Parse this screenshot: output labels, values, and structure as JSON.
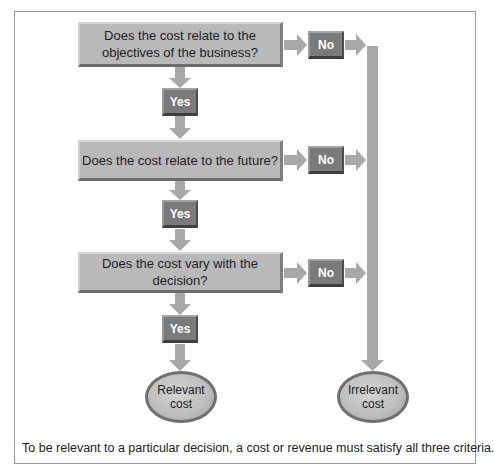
{
  "diagram": {
    "type": "flowchart",
    "questions": [
      {
        "id": "q1",
        "text": "Does the cost relate to the objectives of the business?",
        "line1": "Does the cost relate to the",
        "line2": "objectives of the business?"
      },
      {
        "id": "q2",
        "text": "Does the cost relate to the future?"
      },
      {
        "id": "q3",
        "text": "Does the cost vary with the decision?"
      }
    ],
    "yes_label": "Yes",
    "no_label": "No",
    "outcomes": {
      "relevant": "Relevant cost",
      "irrelevant": "Irrelevant cost"
    },
    "caption": "To be relevant to a particular decision, a cost or revenue must satisfy all three criteria.",
    "colors": {
      "question_box": "#b9b9b9",
      "answer_box": "#7a7a7a",
      "arrow": "#a8a8a8",
      "ellipse": "#bdbdbd",
      "frame": "#9a9a9a"
    },
    "edges": [
      {
        "from": "q1",
        "to": "yes1"
      },
      {
        "from": "yes1",
        "to": "q2"
      },
      {
        "from": "q2",
        "to": "yes2"
      },
      {
        "from": "yes2",
        "to": "q3"
      },
      {
        "from": "q3",
        "to": "yes3"
      },
      {
        "from": "yes3",
        "to": "relevant"
      },
      {
        "from": "q1",
        "to": "no1"
      },
      {
        "from": "no1",
        "to": "irrelevant"
      },
      {
        "from": "q2",
        "to": "no2"
      },
      {
        "from": "no2",
        "to": "irrelevant"
      },
      {
        "from": "q3",
        "to": "no3"
      },
      {
        "from": "no3",
        "to": "irrelevant"
      }
    ]
  }
}
